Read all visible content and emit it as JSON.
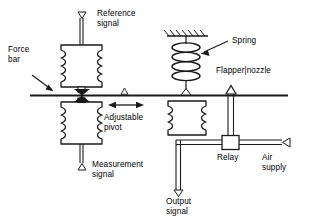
{
  "diagram": {
    "labels": {
      "reference_signal": "Reference\nsignal",
      "force_bar": "Force\nbar",
      "measurement_signal": "Measurement\nsignal",
      "adjustable_pivot": "Adjustable\npivot",
      "spring": "Spring",
      "flapper_nozzle": "Flapper|nozzle",
      "relay": "Relay",
      "air_supply": "Air\nsupply",
      "output_signal": "Output\nsignal"
    },
    "markers": {
      "reference_signal_port": "▽",
      "measurement_signal_port": "△",
      "adjustable_pivot_marker": "△",
      "output_signal_port": "▽",
      "air_supply_port": "◁"
    },
    "components": [
      "upper-bellows",
      "lower-bellows",
      "force-bar",
      "pivot-triangle",
      "range-spring",
      "spring-support-hatching",
      "flapper-nozzle",
      "relay-box",
      "air-supply-line",
      "output-signal-line"
    ],
    "colors": {
      "line": "#1a1a1a",
      "text": "#000000",
      "background": "#ffffff",
      "fill": "#ffffff"
    }
  }
}
